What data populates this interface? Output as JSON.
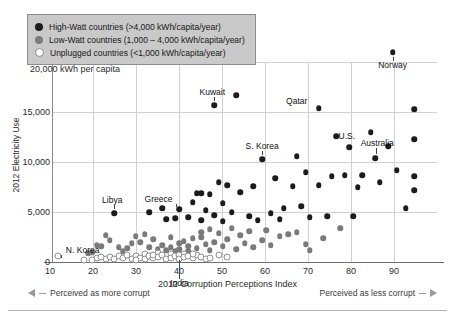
{
  "legend": {
    "position": "top-left",
    "items": [
      {
        "marker": "filled-black-circle-icon",
        "label": "High-Watt countries (>4,000 kWh/capita/year)",
        "color": "#1c1c1c"
      },
      {
        "marker": "filled-gray-circle-icon",
        "label": "Low-Watt countries (1,000 – 4,000 kWh/capita/year)",
        "color": "#7d7d7d"
      },
      {
        "marker": "hollow-circle-icon",
        "label": "Unplugged countries (<1,000 kWh/capita/year)",
        "color": "#ffffff"
      }
    ]
  },
  "axes": {
    "y_title": "2012 Electricity Use",
    "y_top_label": "20,000 kWh per capita",
    "y_ticks": [
      "0",
      "5,000",
      "10,000",
      "15,000"
    ],
    "x_title": "2012 Corruption Perceptions Index",
    "x_ticks": [
      "10",
      "20",
      "30",
      "40",
      "50",
      "60",
      "70",
      "80",
      "90"
    ]
  },
  "notes": {
    "left": "Perceived as more corrupt",
    "right": "Perceived as less corrupt"
  },
  "chart_data": {
    "type": "scatter",
    "title": "",
    "xlabel": "2012 Corruption Perceptions Index",
    "ylabel": "2012 Electricity Use",
    "xlim": [
      4,
      93
    ],
    "ylim": [
      0,
      22000
    ],
    "grid": true,
    "y_gridlines": [
      0,
      5000,
      10000,
      15000,
      20000
    ],
    "x_gridlines": [
      10,
      20,
      30,
      40,
      50,
      60,
      70,
      80,
      90
    ],
    "legend_position": "top-left",
    "series": [
      {
        "name": "High-Watt countries (>4,000 kWh/capita/year)",
        "color": "#1c1c1c",
        "points": [
          {
            "x": 85,
            "y": 21000,
            "label": "Norway"
          },
          {
            "x": 44,
            "y": 15700,
            "label": "Kuwait"
          },
          {
            "x": 49,
            "y": 16700,
            "label": ""
          },
          {
            "x": 68,
            "y": 15400,
            "label": "Qatar"
          },
          {
            "x": 90,
            "y": 15300,
            "label": ""
          },
          {
            "x": 55,
            "y": 10300,
            "label": "S. Korea"
          },
          {
            "x": 72,
            "y": 12600,
            "label": ""
          },
          {
            "x": 80,
            "y": 13000,
            "label": ""
          },
          {
            "x": 90,
            "y": 12300,
            "label": ""
          },
          {
            "x": 84,
            "y": 11600,
            "label": ""
          },
          {
            "x": 75,
            "y": 11500,
            "label": ""
          },
          {
            "x": 81,
            "y": 10400,
            "label": "Australia"
          },
          {
            "x": 63,
            "y": 10600,
            "label": ""
          },
          {
            "x": 65,
            "y": 9000,
            "label": ""
          },
          {
            "x": 71,
            "y": 8600,
            "label": ""
          },
          {
            "x": 74,
            "y": 8700,
            "label": ""
          },
          {
            "x": 78,
            "y": 8700,
            "label": ""
          },
          {
            "x": 86,
            "y": 9200,
            "label": ""
          },
          {
            "x": 90,
            "y": 8600,
            "label": ""
          },
          {
            "x": 58,
            "y": 8400,
            "label": ""
          },
          {
            "x": 62,
            "y": 7600,
            "label": ""
          },
          {
            "x": 68,
            "y": 7700,
            "label": ""
          },
          {
            "x": 82,
            "y": 8000,
            "label": ""
          },
          {
            "x": 77,
            "y": 7500,
            "label": ""
          },
          {
            "x": 90,
            "y": 7200,
            "label": ""
          },
          {
            "x": 53,
            "y": 7600,
            "label": ""
          },
          {
            "x": 50,
            "y": 7000,
            "label": ""
          },
          {
            "x": 47,
            "y": 7700,
            "label": ""
          },
          {
            "x": 45,
            "y": 8000,
            "label": ""
          },
          {
            "x": 43,
            "y": 6800,
            "label": ""
          },
          {
            "x": 41,
            "y": 6900,
            "label": ""
          },
          {
            "x": 40,
            "y": 6900,
            "label": ""
          },
          {
            "x": 39,
            "y": 6000,
            "label": ""
          },
          {
            "x": 36,
            "y": 5300,
            "label": "Greece"
          },
          {
            "x": 32,
            "y": 5400,
            "label": ""
          },
          {
            "x": 21,
            "y": 4900,
            "label": "Libya"
          },
          {
            "x": 29,
            "y": 5000,
            "label": ""
          },
          {
            "x": 42,
            "y": 5200,
            "label": ""
          },
          {
            "x": 44,
            "y": 4700,
            "label": ""
          },
          {
            "x": 46,
            "y": 5900,
            "label": ""
          },
          {
            "x": 48,
            "y": 5000,
            "label": ""
          },
          {
            "x": 52,
            "y": 4600,
            "label": ""
          },
          {
            "x": 57,
            "y": 4900,
            "label": ""
          },
          {
            "x": 60,
            "y": 5400,
            "label": ""
          },
          {
            "x": 64,
            "y": 5600,
            "label": ""
          },
          {
            "x": 66,
            "y": 4500,
            "label": ""
          },
          {
            "x": 70,
            "y": 4600,
            "label": ""
          },
          {
            "x": 76,
            "y": 4600,
            "label": ""
          },
          {
            "x": 88,
            "y": 5400,
            "label": ""
          },
          {
            "x": 35,
            "y": 4400,
            "label": ""
          },
          {
            "x": 38,
            "y": 4500,
            "label": ""
          },
          {
            "x": 33,
            "y": 4300,
            "label": ""
          },
          {
            "x": 54,
            "y": 4200,
            "label": ""
          },
          {
            "x": 59,
            "y": 4300,
            "label": ""
          },
          {
            "x": 41,
            "y": 4200,
            "label": ""
          },
          {
            "x": 46,
            "y": 4100,
            "label": ""
          }
        ]
      },
      {
        "name": "Low-Watt countries (1,000 – 4,000 kWh/capita/year)",
        "color": "#7a7a7a",
        "points": [
          {
            "x": 17,
            "y": 1700,
            "label": ""
          },
          {
            "x": 18,
            "y": 1600,
            "label": ""
          },
          {
            "x": 19,
            "y": 2700,
            "label": ""
          },
          {
            "x": 20,
            "y": 2200,
            "label": ""
          },
          {
            "x": 22,
            "y": 1500,
            "label": ""
          },
          {
            "x": 24,
            "y": 1400,
            "label": ""
          },
          {
            "x": 25,
            "y": 1900,
            "label": ""
          },
          {
            "x": 26,
            "y": 2600,
            "label": ""
          },
          {
            "x": 27,
            "y": 2000,
            "label": ""
          },
          {
            "x": 28,
            "y": 2800,
            "label": ""
          },
          {
            "x": 29,
            "y": 1500,
            "label": ""
          },
          {
            "x": 30,
            "y": 2300,
            "label": ""
          },
          {
            "x": 31,
            "y": 1300,
            "label": ""
          },
          {
            "x": 32,
            "y": 1700,
            "label": ""
          },
          {
            "x": 33,
            "y": 1200,
            "label": ""
          },
          {
            "x": 34,
            "y": 2500,
            "label": ""
          },
          {
            "x": 34,
            "y": 1500,
            "label": ""
          },
          {
            "x": 35,
            "y": 1100,
            "label": ""
          },
          {
            "x": 36,
            "y": 1900,
            "label": ""
          },
          {
            "x": 36,
            "y": 1300,
            "label": ""
          },
          {
            "x": 37,
            "y": 2100,
            "label": ""
          },
          {
            "x": 38,
            "y": 1600,
            "label": ""
          },
          {
            "x": 38,
            "y": 1100,
            "label": ""
          },
          {
            "x": 39,
            "y": 2400,
            "label": ""
          },
          {
            "x": 40,
            "y": 1400,
            "label": ""
          },
          {
            "x": 41,
            "y": 3000,
            "label": ""
          },
          {
            "x": 41,
            "y": 2500,
            "label": ""
          },
          {
            "x": 42,
            "y": 1800,
            "label": ""
          },
          {
            "x": 43,
            "y": 3300,
            "label": ""
          },
          {
            "x": 43,
            "y": 1200,
            "label": ""
          },
          {
            "x": 44,
            "y": 2000,
            "label": ""
          },
          {
            "x": 45,
            "y": 2900,
            "label": ""
          },
          {
            "x": 46,
            "y": 1600,
            "label": ""
          },
          {
            "x": 47,
            "y": 2300,
            "label": ""
          },
          {
            "x": 48,
            "y": 3400,
            "label": ""
          },
          {
            "x": 49,
            "y": 1300,
            "label": ""
          },
          {
            "x": 50,
            "y": 2700,
            "label": ""
          },
          {
            "x": 51,
            "y": 1900,
            "label": ""
          },
          {
            "x": 52,
            "y": 3100,
            "label": ""
          },
          {
            "x": 53,
            "y": 1500,
            "label": ""
          },
          {
            "x": 55,
            "y": 2200,
            "label": ""
          },
          {
            "x": 56,
            "y": 3200,
            "label": ""
          },
          {
            "x": 57,
            "y": 1700,
            "label": ""
          },
          {
            "x": 59,
            "y": 2600,
            "label": ""
          },
          {
            "x": 61,
            "y": 2800,
            "label": ""
          },
          {
            "x": 63,
            "y": 3000,
            "label": ""
          },
          {
            "x": 65,
            "y": 1800,
            "label": ""
          },
          {
            "x": 66,
            "y": 1200,
            "label": ""
          },
          {
            "x": 69,
            "y": 2400,
            "label": ""
          },
          {
            "x": 73,
            "y": 3400,
            "label": ""
          },
          {
            "x": 15,
            "y": 900,
            "label": ""
          },
          {
            "x": 16,
            "y": 1000,
            "label": ""
          },
          {
            "x": 23,
            "y": 1100,
            "label": ""
          }
        ]
      },
      {
        "name": "Unplugged countries (<1,000 kWh/capita/year)",
        "color": "#ffffff",
        "points": [
          {
            "x": 8,
            "y": 600,
            "label": "N. Korea"
          },
          {
            "x": 14,
            "y": 200,
            "label": ""
          },
          {
            "x": 17,
            "y": 400,
            "label": ""
          },
          {
            "x": 19,
            "y": 300,
            "label": ""
          },
          {
            "x": 20,
            "y": 500,
            "label": ""
          },
          {
            "x": 21,
            "y": 300,
            "label": ""
          },
          {
            "x": 22,
            "y": 600,
            "label": ""
          },
          {
            "x": 23,
            "y": 400,
            "label": ""
          },
          {
            "x": 24,
            "y": 700,
            "label": ""
          },
          {
            "x": 25,
            "y": 350,
            "label": ""
          },
          {
            "x": 26,
            "y": 600,
            "label": ""
          },
          {
            "x": 27,
            "y": 450,
            "label": ""
          },
          {
            "x": 28,
            "y": 800,
            "label": ""
          },
          {
            "x": 28,
            "y": 300,
            "label": ""
          },
          {
            "x": 29,
            "y": 650,
            "label": ""
          },
          {
            "x": 30,
            "y": 400,
            "label": ""
          },
          {
            "x": 31,
            "y": 900,
            "label": ""
          },
          {
            "x": 31,
            "y": 500,
            "label": ""
          },
          {
            "x": 32,
            "y": 700,
            "label": ""
          },
          {
            "x": 33,
            "y": 350,
            "label": ""
          },
          {
            "x": 34,
            "y": 800,
            "label": ""
          },
          {
            "x": 34,
            "y": 450,
            "label": ""
          },
          {
            "x": 35,
            "y": 600,
            "label": ""
          },
          {
            "x": 36,
            "y": 700,
            "label": "India"
          },
          {
            "x": 36,
            "y": 300,
            "label": ""
          },
          {
            "x": 37,
            "y": 850,
            "label": ""
          },
          {
            "x": 37,
            "y": 500,
            "label": ""
          },
          {
            "x": 38,
            "y": 650,
            "label": ""
          },
          {
            "x": 39,
            "y": 400,
            "label": ""
          },
          {
            "x": 40,
            "y": 750,
            "label": ""
          },
          {
            "x": 41,
            "y": 550,
            "label": ""
          },
          {
            "x": 42,
            "y": 300,
            "label": ""
          },
          {
            "x": 45,
            "y": 700,
            "label": ""
          },
          {
            "x": 47,
            "y": 500,
            "label": ""
          },
          {
            "x": 16,
            "y": 250,
            "label": ""
          },
          {
            "x": 18,
            "y": 550,
            "label": ""
          },
          {
            "x": 26,
            "y": 250,
            "label": ""
          },
          {
            "x": 30,
            "y": 750,
            "label": ""
          },
          {
            "x": 39,
            "y": 850,
            "label": ""
          },
          {
            "x": 43,
            "y": 400,
            "label": ""
          }
        ]
      }
    ],
    "annotations": [
      {
        "text": "Norway",
        "x": 85,
        "y": 21000
      },
      {
        "text": "Kuwait",
        "x": 44,
        "y": 15700
      },
      {
        "text": "Qatar",
        "x": 68,
        "y": 15400
      },
      {
        "text": "S. Korea",
        "x": 55,
        "y": 10300
      },
      {
        "text": "-U.S.",
        "x": 70,
        "y": 12600
      },
      {
        "text": "Australia",
        "x": 81,
        "y": 10400
      },
      {
        "text": "Greece",
        "x": 36,
        "y": 5300
      },
      {
        "text": "Libya",
        "x": 21,
        "y": 4900
      },
      {
        "text": "N. Korea",
        "x": 8,
        "y": 600
      },
      {
        "text": "India",
        "x": 36,
        "y": 700
      }
    ]
  }
}
